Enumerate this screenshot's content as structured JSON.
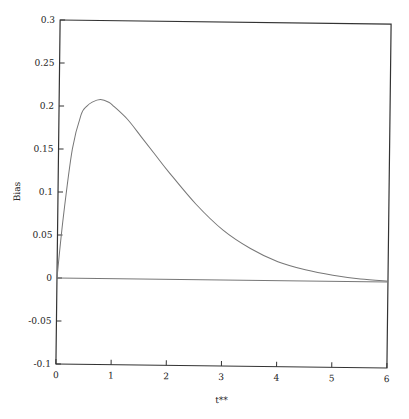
{
  "chart_data": {
    "type": "line",
    "title": "",
    "xlabel": "t**",
    "ylabel": "Bias",
    "xlim": [
      0,
      6
    ],
    "ylim": [
      -0.1,
      0.3
    ],
    "xticks": [
      0,
      1,
      2,
      3,
      4,
      5,
      6
    ],
    "xtick_labels": [
      "0",
      "1",
      "2",
      "3",
      "4",
      "5",
      "6"
    ],
    "yticks": [
      -0.1,
      -0.05,
      0,
      0.05,
      0.1,
      0.15,
      0.2,
      0.25,
      0.3
    ],
    "ytick_labels": [
      "-0.1",
      "-0.05",
      "0",
      "0.05",
      "0.1",
      "0.15",
      "0.2",
      "0.25",
      "0.3"
    ],
    "grid": false,
    "legend": "none",
    "series": [
      {
        "name": "bias-curve",
        "color": "#777777",
        "x": [
          0,
          0.1,
          0.25,
          0.4,
          0.5,
          0.6,
          0.75,
          0.9,
          1.0,
          1.25,
          1.5,
          1.75,
          2.0,
          2.5,
          3.0,
          3.5,
          4.0,
          4.5,
          5.0,
          5.5,
          6.0
        ],
        "y": [
          0,
          0.07,
          0.15,
          0.19,
          0.2,
          0.205,
          0.208,
          0.205,
          0.2,
          0.185,
          0.165,
          0.145,
          0.125,
          0.088,
          0.058,
          0.037,
          0.022,
          0.013,
          0.007,
          0.003,
          0.001
        ]
      },
      {
        "name": "zero-line",
        "color": "#777777",
        "x": [
          0,
          6
        ],
        "y": [
          0,
          0
        ]
      }
    ]
  }
}
